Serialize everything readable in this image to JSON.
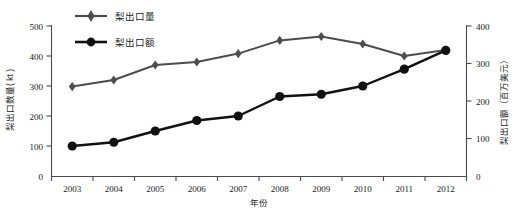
{
  "chart_data": {
    "type": "line",
    "title": "",
    "xlabel": "年份",
    "categories": [
      "2003",
      "2004",
      "2005",
      "2006",
      "2007",
      "2008",
      "2009",
      "2010",
      "2011",
      "2012"
    ],
    "grid": false,
    "legend_position": "top-center",
    "series": [
      {
        "name": "梨出口量",
        "axis": "left",
        "unit": "kt",
        "color": "#4d4d4d",
        "marker": "diamond",
        "values": [
          298,
          320,
          370,
          380,
          408,
          452,
          465,
          440,
          400,
          420
        ]
      },
      {
        "name": "梨出口额",
        "axis": "right",
        "unit": "百万美元",
        "color": "#111111",
        "marker": "circle",
        "values": [
          80,
          90,
          120,
          148,
          160,
          212,
          218,
          240,
          285,
          335
        ]
      }
    ],
    "axes": {
      "left": {
        "label": "梨出口数量( kt )",
        "ticks": [
          "0",
          "100",
          "200",
          "300",
          "400",
          "500"
        ],
        "min": 0,
        "max": 500
      },
      "right": {
        "label": "梨出口额（百万美元）",
        "ticks": [
          "0",
          "100",
          "200",
          "300",
          "400"
        ],
        "min": 0,
        "max": 400
      }
    }
  },
  "legend": {
    "items": [
      {
        "label": "梨出口量"
      },
      {
        "label": "梨出口额"
      }
    ]
  }
}
